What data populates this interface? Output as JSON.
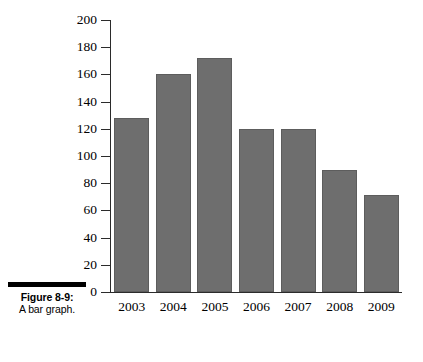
{
  "figure": {
    "caption_title": "Figure 8-9:",
    "caption_subtitle": "A bar graph."
  },
  "chart_data": {
    "type": "bar",
    "title": "",
    "subtitle": "",
    "xlabel": "",
    "ylabel": "",
    "categories": [
      "2003",
      "2004",
      "2005",
      "2006",
      "2007",
      "2008",
      "2009"
    ],
    "values": [
      128,
      160,
      172,
      120,
      120,
      90,
      71
    ],
    "series": [
      {
        "name": "",
        "values": [
          128,
          160,
          172,
          120,
          120,
          90,
          71
        ]
      }
    ],
    "ylim": [
      0,
      200
    ],
    "yticks": [
      0,
      20,
      40,
      60,
      80,
      100,
      120,
      140,
      160,
      180,
      200
    ],
    "ytick_labels": [
      "0",
      "20",
      "40",
      "60",
      "80",
      "100",
      "120",
      "140",
      "160",
      "180",
      "200"
    ],
    "xtick_labels": [
      "2003",
      "2004",
      "2005",
      "2006",
      "2007",
      "2008",
      "2009"
    ],
    "grid": false,
    "legend": false,
    "legend_position": "none",
    "annotations": [],
    "colors": {
      "bar_fill": "#6e6e6e",
      "bar_edge": "#5d5d5d",
      "axis": "#2b2b2b",
      "text": "#000000",
      "background": "#ffffff",
      "caption_rule": "#000000"
    }
  }
}
